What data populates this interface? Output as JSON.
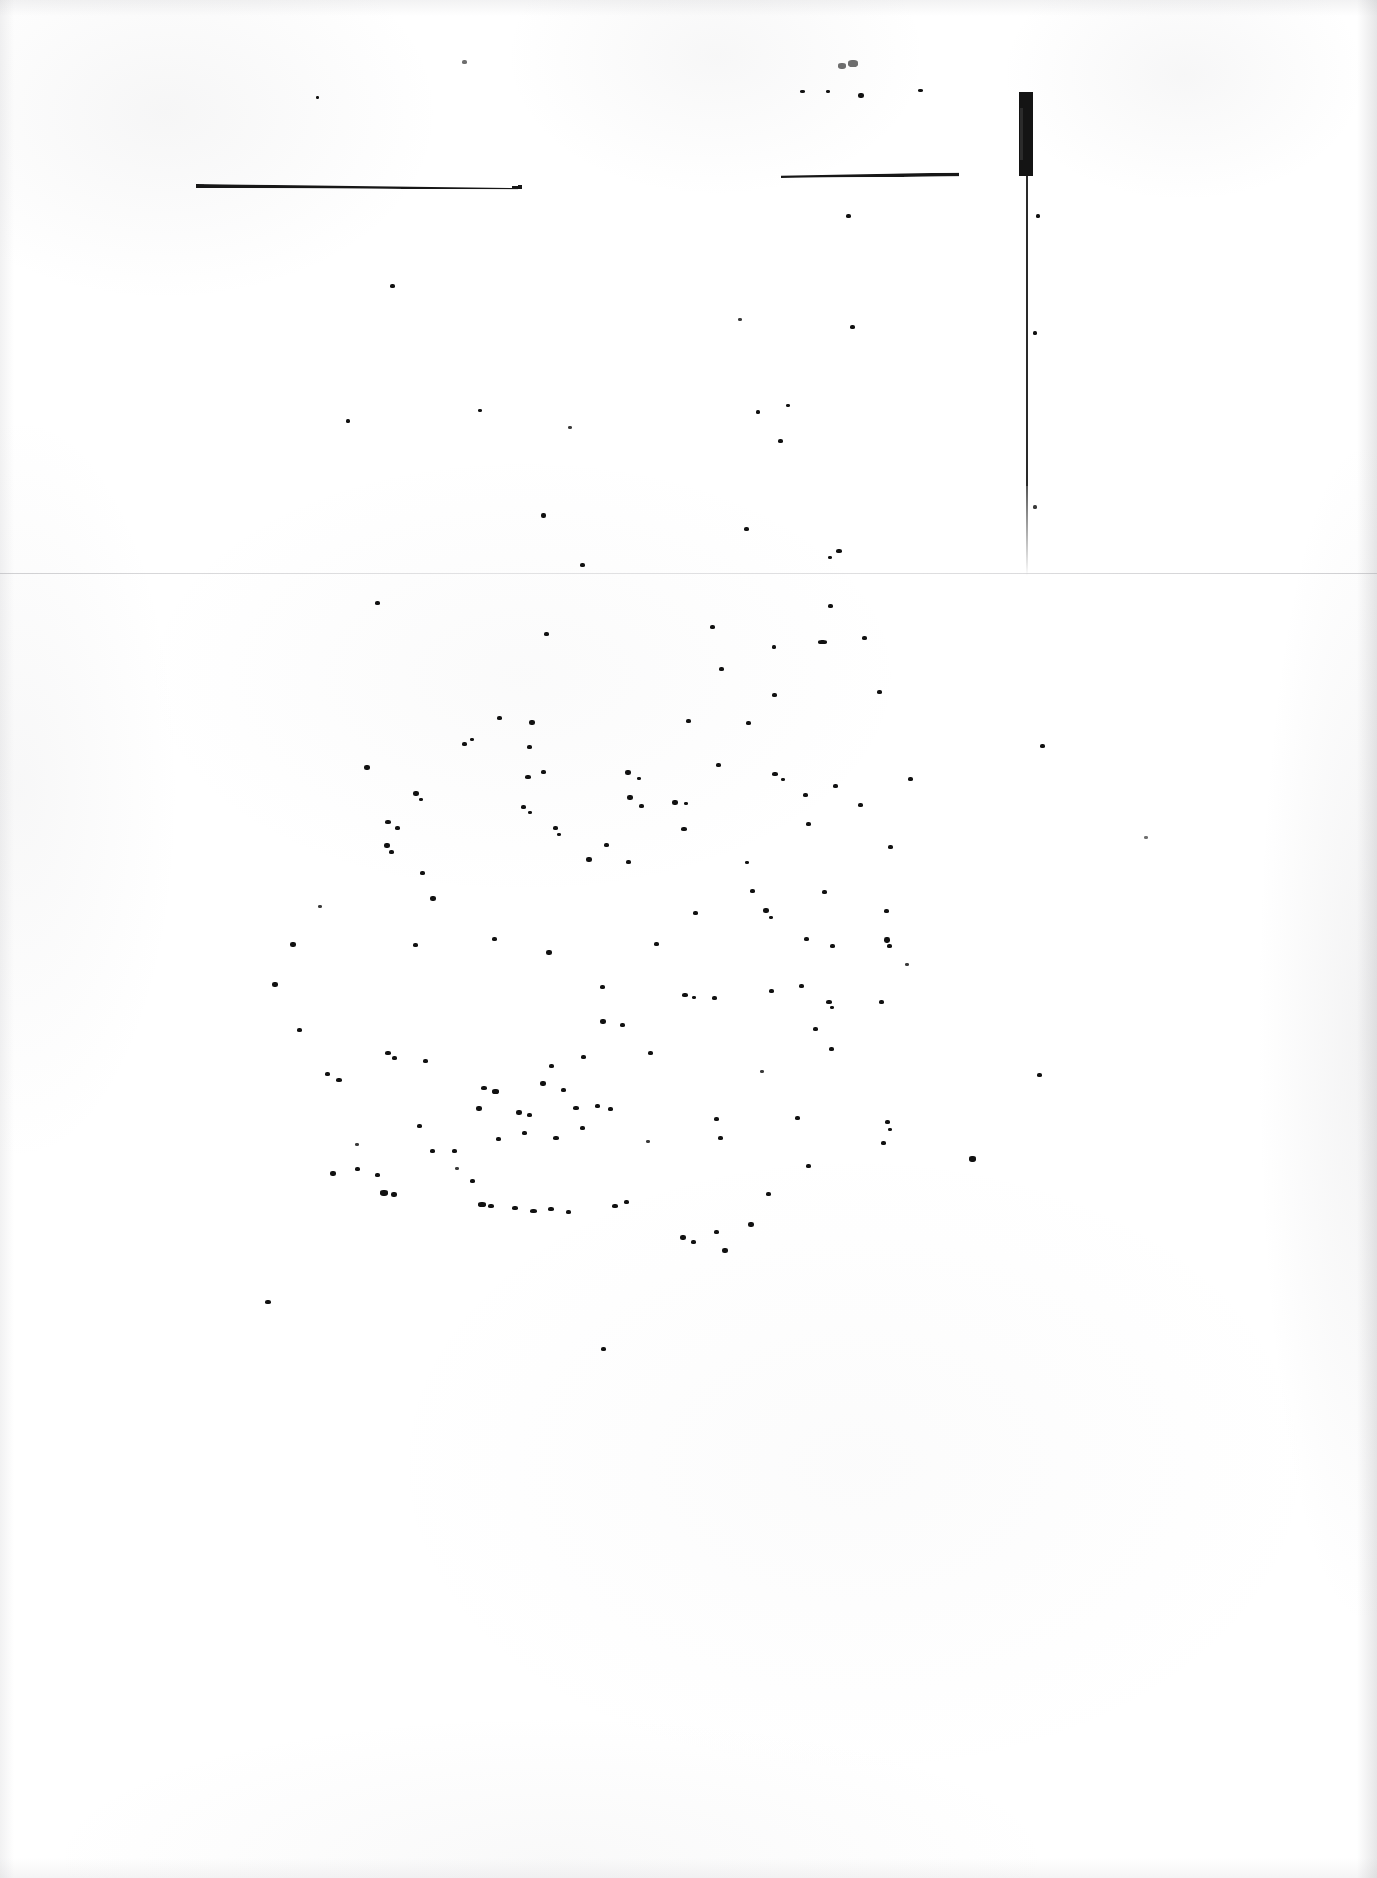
{
  "document": {
    "kind": "scanned-page",
    "condition": "severely-degraded",
    "legible_text": "",
    "note": "No legible text survives on this scan; only ink rules, a vertical bar and scattered speckles remain.",
    "page_width": 1377,
    "page_height": 1878
  },
  "colors": {
    "page_background": "#ffffff",
    "ink": "#111111",
    "ink_rule": "#171717",
    "ink_faded": "#6e6e6e",
    "fold_line": "#aaaaae",
    "edge_shadow": "#8c8c92"
  },
  "marks": {
    "rule_left": {
      "label": "",
      "x": 196,
      "y": 184,
      "width": 322
    },
    "rule_right": {
      "label": "",
      "x": 781,
      "y": 174,
      "width": 178
    },
    "bar_vertical": {
      "label": "",
      "x": 1019,
      "y": 92,
      "thick_height": 84,
      "hairline_height": 400
    },
    "fold_divider": {
      "label": "",
      "y": 573
    }
  },
  "regions": {
    "upper": {
      "label": ""
    },
    "lower": {
      "label": ""
    }
  },
  "speckles": {
    "upper": [
      [
        316,
        96,
        3,
        3,
        ""
      ],
      [
        462,
        60,
        5,
        4,
        "faint"
      ],
      [
        800,
        90,
        5,
        3,
        ""
      ],
      [
        826,
        90,
        4,
        3,
        ""
      ],
      [
        858,
        93,
        6,
        5,
        ""
      ],
      [
        918,
        89,
        5,
        3,
        ""
      ],
      [
        838,
        63,
        8,
        6,
        "faint"
      ],
      [
        848,
        60,
        10,
        7,
        "faint"
      ],
      [
        846,
        214,
        5,
        4,
        ""
      ],
      [
        390,
        284,
        5,
        4,
        ""
      ],
      [
        738,
        318,
        4,
        3,
        "mid"
      ],
      [
        850,
        325,
        5,
        4,
        ""
      ],
      [
        346,
        419,
        4,
        4,
        ""
      ],
      [
        478,
        409,
        4,
        3,
        ""
      ],
      [
        568,
        426,
        4,
        3,
        "mid"
      ],
      [
        756,
        410,
        4,
        4,
        ""
      ],
      [
        786,
        404,
        4,
        3,
        ""
      ],
      [
        778,
        439,
        5,
        4,
        ""
      ],
      [
        541,
        513,
        5,
        5,
        ""
      ],
      [
        744,
        527,
        5,
        4,
        ""
      ],
      [
        836,
        549,
        6,
        4,
        ""
      ],
      [
        828,
        556,
        4,
        3,
        ""
      ],
      [
        580,
        563,
        5,
        4,
        ""
      ],
      [
        1036,
        214,
        4,
        4,
        ""
      ],
      [
        1033,
        331,
        4,
        4,
        ""
      ],
      [
        1033,
        505,
        4,
        4,
        "mid"
      ]
    ],
    "lower": [
      [
        375,
        601,
        5,
        4,
        ""
      ],
      [
        828,
        604,
        5,
        4,
        ""
      ],
      [
        544,
        632,
        5,
        4,
        ""
      ],
      [
        710,
        625,
        5,
        4,
        ""
      ],
      [
        772,
        645,
        4,
        4,
        ""
      ],
      [
        818,
        640,
        9,
        4,
        ""
      ],
      [
        862,
        636,
        5,
        4,
        ""
      ],
      [
        719,
        667,
        5,
        4,
        ""
      ],
      [
        772,
        693,
        5,
        4,
        ""
      ],
      [
        877,
        690,
        5,
        4,
        ""
      ],
      [
        497,
        716,
        5,
        4,
        ""
      ],
      [
        529,
        720,
        6,
        5,
        ""
      ],
      [
        686,
        719,
        5,
        4,
        ""
      ],
      [
        746,
        721,
        5,
        4,
        ""
      ],
      [
        364,
        765,
        6,
        5,
        ""
      ],
      [
        462,
        742,
        5,
        4,
        ""
      ],
      [
        470,
        738,
        4,
        3,
        ""
      ],
      [
        527,
        745,
        5,
        4,
        ""
      ],
      [
        525,
        775,
        6,
        4,
        ""
      ],
      [
        541,
        770,
        5,
        4,
        ""
      ],
      [
        625,
        770,
        6,
        5,
        ""
      ],
      [
        637,
        777,
        4,
        3,
        ""
      ],
      [
        716,
        763,
        5,
        4,
        ""
      ],
      [
        772,
        772,
        6,
        4,
        ""
      ],
      [
        781,
        778,
        4,
        3,
        ""
      ],
      [
        833,
        784,
        5,
        4,
        ""
      ],
      [
        908,
        777,
        5,
        4,
        ""
      ],
      [
        413,
        791,
        6,
        5,
        ""
      ],
      [
        419,
        798,
        4,
        3,
        ""
      ],
      [
        521,
        805,
        5,
        4,
        ""
      ],
      [
        528,
        811,
        4,
        3,
        ""
      ],
      [
        627,
        795,
        6,
        5,
        ""
      ],
      [
        639,
        804,
        5,
        4,
        ""
      ],
      [
        672,
        800,
        6,
        5,
        ""
      ],
      [
        684,
        802,
        4,
        3,
        ""
      ],
      [
        803,
        793,
        5,
        4,
        ""
      ],
      [
        858,
        803,
        5,
        4,
        ""
      ],
      [
        385,
        820,
        6,
        4,
        ""
      ],
      [
        395,
        826,
        5,
        4,
        ""
      ],
      [
        553,
        826,
        5,
        4,
        ""
      ],
      [
        557,
        833,
        4,
        3,
        ""
      ],
      [
        604,
        843,
        5,
        4,
        ""
      ],
      [
        681,
        827,
        6,
        4,
        ""
      ],
      [
        806,
        822,
        5,
        4,
        ""
      ],
      [
        384,
        843,
        6,
        5,
        ""
      ],
      [
        389,
        850,
        5,
        4,
        ""
      ],
      [
        586,
        857,
        6,
        5,
        ""
      ],
      [
        626,
        860,
        5,
        4,
        ""
      ],
      [
        745,
        861,
        4,
        3,
        ""
      ],
      [
        888,
        845,
        5,
        4,
        ""
      ],
      [
        420,
        871,
        5,
        4,
        ""
      ],
      [
        430,
        896,
        6,
        5,
        ""
      ],
      [
        750,
        889,
        5,
        4,
        ""
      ],
      [
        763,
        908,
        6,
        5,
        ""
      ],
      [
        769,
        916,
        4,
        3,
        ""
      ],
      [
        822,
        890,
        5,
        4,
        ""
      ],
      [
        693,
        911,
        5,
        4,
        ""
      ],
      [
        884,
        909,
        5,
        4,
        ""
      ],
      [
        290,
        942,
        6,
        5,
        ""
      ],
      [
        413,
        943,
        5,
        4,
        ""
      ],
      [
        492,
        937,
        5,
        4,
        ""
      ],
      [
        546,
        950,
        6,
        5,
        ""
      ],
      [
        654,
        942,
        5,
        4,
        ""
      ],
      [
        804,
        937,
        5,
        4,
        ""
      ],
      [
        830,
        944,
        5,
        4,
        ""
      ],
      [
        884,
        937,
        6,
        6,
        ""
      ],
      [
        887,
        944,
        5,
        4,
        ""
      ],
      [
        272,
        982,
        6,
        5,
        ""
      ],
      [
        600,
        985,
        5,
        4,
        ""
      ],
      [
        682,
        993,
        6,
        4,
        ""
      ],
      [
        692,
        996,
        4,
        3,
        ""
      ],
      [
        712,
        996,
        5,
        4,
        ""
      ],
      [
        769,
        989,
        5,
        4,
        ""
      ],
      [
        799,
        984,
        5,
        4,
        ""
      ],
      [
        826,
        1000,
        6,
        4,
        ""
      ],
      [
        830,
        1006,
        4,
        3,
        ""
      ],
      [
        879,
        1000,
        5,
        4,
        ""
      ],
      [
        600,
        1019,
        6,
        5,
        ""
      ],
      [
        620,
        1023,
        5,
        4,
        ""
      ],
      [
        813,
        1027,
        5,
        4,
        ""
      ],
      [
        297,
        1028,
        5,
        4,
        ""
      ],
      [
        385,
        1051,
        6,
        4,
        ""
      ],
      [
        392,
        1056,
        5,
        4,
        ""
      ],
      [
        581,
        1055,
        5,
        4,
        ""
      ],
      [
        549,
        1064,
        5,
        4,
        ""
      ],
      [
        648,
        1051,
        5,
        4,
        ""
      ],
      [
        829,
        1047,
        5,
        4,
        ""
      ],
      [
        325,
        1072,
        5,
        4,
        ""
      ],
      [
        336,
        1078,
        6,
        4,
        ""
      ],
      [
        423,
        1059,
        5,
        4,
        ""
      ],
      [
        481,
        1086,
        6,
        4,
        ""
      ],
      [
        492,
        1089,
        7,
        5,
        ""
      ],
      [
        540,
        1081,
        6,
        5,
        ""
      ],
      [
        561,
        1088,
        5,
        4,
        ""
      ],
      [
        573,
        1106,
        6,
        4,
        ""
      ],
      [
        595,
        1104,
        5,
        4,
        ""
      ],
      [
        608,
        1107,
        5,
        4,
        ""
      ],
      [
        516,
        1110,
        6,
        5,
        ""
      ],
      [
        527,
        1113,
        5,
        4,
        ""
      ],
      [
        476,
        1106,
        6,
        5,
        ""
      ],
      [
        714,
        1117,
        5,
        4,
        ""
      ],
      [
        795,
        1116,
        5,
        4,
        ""
      ],
      [
        885,
        1120,
        5,
        4,
        ""
      ],
      [
        888,
        1128,
        4,
        3,
        ""
      ],
      [
        881,
        1141,
        5,
        4,
        ""
      ],
      [
        417,
        1124,
        5,
        4,
        ""
      ],
      [
        430,
        1149,
        5,
        4,
        ""
      ],
      [
        452,
        1149,
        5,
        4,
        ""
      ],
      [
        496,
        1137,
        5,
        4,
        ""
      ],
      [
        522,
        1131,
        5,
        4,
        ""
      ],
      [
        553,
        1136,
        6,
        4,
        ""
      ],
      [
        580,
        1126,
        5,
        4,
        ""
      ],
      [
        718,
        1136,
        5,
        4,
        ""
      ],
      [
        330,
        1171,
        6,
        5,
        ""
      ],
      [
        355,
        1167,
        5,
        4,
        ""
      ],
      [
        375,
        1173,
        5,
        4,
        ""
      ],
      [
        380,
        1190,
        8,
        6,
        ""
      ],
      [
        391,
        1192,
        6,
        5,
        ""
      ],
      [
        470,
        1179,
        5,
        4,
        ""
      ],
      [
        478,
        1202,
        8,
        5,
        ""
      ],
      [
        488,
        1204,
        6,
        4,
        ""
      ],
      [
        512,
        1206,
        6,
        4,
        ""
      ],
      [
        530,
        1209,
        7,
        4,
        ""
      ],
      [
        548,
        1207,
        6,
        4,
        ""
      ],
      [
        566,
        1210,
        5,
        4,
        ""
      ],
      [
        612,
        1204,
        6,
        4,
        ""
      ],
      [
        624,
        1200,
        5,
        4,
        ""
      ],
      [
        766,
        1192,
        5,
        4,
        ""
      ],
      [
        680,
        1235,
        6,
        5,
        ""
      ],
      [
        691,
        1240,
        5,
        4,
        ""
      ],
      [
        714,
        1230,
        5,
        4,
        ""
      ],
      [
        722,
        1248,
        6,
        5,
        ""
      ],
      [
        748,
        1222,
        6,
        5,
        ""
      ],
      [
        806,
        1164,
        5,
        4,
        ""
      ],
      [
        969,
        1156,
        7,
        6,
        ""
      ],
      [
        1037,
        1073,
        5,
        4,
        ""
      ],
      [
        1040,
        744,
        5,
        4,
        ""
      ],
      [
        1144,
        836,
        4,
        3,
        "faint"
      ],
      [
        265,
        1300,
        6,
        4,
        ""
      ],
      [
        601,
        1347,
        5,
        4,
        ""
      ],
      [
        355,
        1143,
        4,
        3,
        "mid"
      ],
      [
        455,
        1167,
        4,
        3,
        "mid"
      ],
      [
        646,
        1140,
        4,
        3,
        "mid"
      ],
      [
        318,
        905,
        4,
        3,
        "mid"
      ],
      [
        905,
        963,
        4,
        3,
        "mid"
      ],
      [
        760,
        1070,
        4,
        3,
        "mid"
      ]
    ]
  }
}
